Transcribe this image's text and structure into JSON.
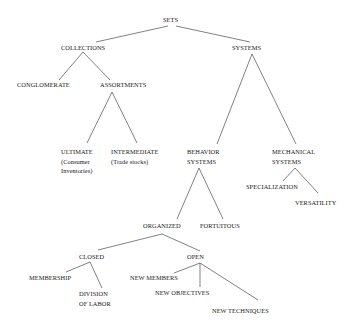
{
  "diagram": {
    "type": "tree",
    "title": "SETS",
    "nodes": {
      "sets": {
        "lines": [
          "SETS"
        ]
      },
      "collections": {
        "lines": [
          "COLLECTIONS"
        ]
      },
      "systems": {
        "lines": [
          "SYSTEMS"
        ]
      },
      "conglomerate": {
        "lines": [
          "CONGLOMERATE"
        ]
      },
      "assortments": {
        "lines": [
          "ASSORTMENTS"
        ]
      },
      "ultimate": {
        "lines": [
          "ULTIMATE",
          "(Consumer",
          "Inventories)"
        ]
      },
      "intermediate": {
        "lines": [
          "INTERMEDIATE",
          "(Trade stocks)"
        ]
      },
      "behavior_systems": {
        "lines": [
          "BEHAVIOR",
          "SYSTEMS"
        ]
      },
      "mechanical_systems": {
        "lines": [
          "MECHANICAL",
          "SYSTEMS"
        ]
      },
      "specialization": {
        "lines": [
          "SPECIALIZATION"
        ]
      },
      "versatility": {
        "lines": [
          "VERSATILITY"
        ]
      },
      "organized": {
        "lines": [
          "ORGANIZED"
        ]
      },
      "fortuitous": {
        "lines": [
          "FORTUITOUS"
        ]
      },
      "closed": {
        "lines": [
          "CLOSED"
        ]
      },
      "open": {
        "lines": [
          "OPEN"
        ]
      },
      "membership": {
        "lines": [
          "MEMBERSHIP"
        ]
      },
      "division_of_labor": {
        "lines": [
          "DIVISION",
          "OF LABOR"
        ]
      },
      "new_members": {
        "lines": [
          "NEW MEMBERS"
        ]
      },
      "new_objectives": {
        "lines": [
          "NEW OBJECTIVES"
        ]
      },
      "new_techniques": {
        "lines": [
          "NEW TECHNIQUES"
        ]
      }
    },
    "edges": [
      [
        "sets",
        "collections"
      ],
      [
        "sets",
        "systems"
      ],
      [
        "collections",
        "conglomerate"
      ],
      [
        "collections",
        "assortments"
      ],
      [
        "assortments",
        "ultimate"
      ],
      [
        "assortments",
        "intermediate"
      ],
      [
        "systems",
        "behavior_systems"
      ],
      [
        "systems",
        "mechanical_systems"
      ],
      [
        "mechanical_systems",
        "specialization"
      ],
      [
        "mechanical_systems",
        "versatility"
      ],
      [
        "behavior_systems",
        "organized"
      ],
      [
        "behavior_systems",
        "fortuitous"
      ],
      [
        "organized",
        "closed"
      ],
      [
        "organized",
        "open"
      ],
      [
        "closed",
        "membership"
      ],
      [
        "closed",
        "division_of_labor"
      ],
      [
        "open",
        "new_members"
      ],
      [
        "open",
        "new_objectives"
      ],
      [
        "open",
        "new_techniques"
      ]
    ],
    "line_color": "#4a4a4a",
    "text_color": "#1a1a1a"
  }
}
